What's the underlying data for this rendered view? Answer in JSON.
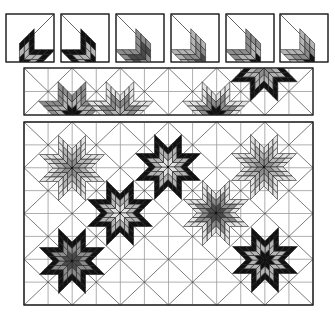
{
  "figure": {
    "palette": {
      "white": "#ffffff",
      "light": "#e2e2e2",
      "mid": "#b4b4b4",
      "grey": "#8c8c8c",
      "dark": "#4a4a4a",
      "black": "#111111",
      "line": "#222222",
      "grid": "#9a9a9a"
    }
  },
  "blocks": [
    {
      "x": 6,
      "y": 14,
      "s": 48,
      "corner": "tr",
      "shades": [
        "black",
        "mid",
        "black"
      ]
    },
    {
      "x": 61,
      "y": 14,
      "s": 48,
      "corner": "tl",
      "shades": [
        "black",
        "mid",
        "black"
      ]
    },
    {
      "x": 116,
      "y": 14,
      "s": 48,
      "corner": "tl",
      "shades": [
        "grey",
        "dark",
        "grey"
      ]
    },
    {
      "x": 171,
      "y": 14,
      "s": 48,
      "corner": "tl",
      "shades": [
        "dark",
        "grey",
        "mid"
      ]
    },
    {
      "x": 226,
      "y": 14,
      "s": 48,
      "corner": "tl",
      "shades": [
        "black",
        "mid",
        "grey"
      ]
    },
    {
      "x": 280,
      "y": 14,
      "s": 48,
      "corner": "tl",
      "shades": [
        "black",
        "grey",
        "mid"
      ]
    }
  ],
  "strip": {
    "x": 24,
    "y": 68,
    "w": 289,
    "h": 47,
    "cols": 12,
    "rows": 2,
    "stars": [
      {
        "cx": 72,
        "cy": 115,
        "arms": [
          0,
          1,
          2,
          3
        ],
        "shades": [
          "black",
          "mid",
          "grey"
        ]
      },
      {
        "cx": 120,
        "cy": 115,
        "arms": [
          4,
          5,
          6,
          7
        ],
        "shades": [
          "mid",
          "grey",
          "light"
        ]
      },
      {
        "cx": 216,
        "cy": 115,
        "arms": [
          4,
          5,
          6,
          7
        ],
        "shades": [
          "black",
          "grey",
          "light"
        ]
      },
      {
        "cx": 264,
        "cy": 68,
        "arms": [
          0,
          1,
          2,
          3
        ],
        "shades": [
          "grey",
          "mid",
          "black"
        ]
      }
    ]
  },
  "quilt": {
    "x": 24,
    "y": 122,
    "w": 289,
    "h": 183,
    "cols": 12,
    "rows": 8,
    "stars": [
      {
        "cx": 72,
        "cy": 168,
        "shades": [
          "grey",
          "mid",
          "light"
        ]
      },
      {
        "cx": 168,
        "cy": 167,
        "shades": [
          "light",
          "mid",
          "black"
        ]
      },
      {
        "cx": 264,
        "cy": 167,
        "shades": [
          "grey",
          "mid",
          "light"
        ]
      },
      {
        "cx": 120,
        "cy": 213,
        "shades": [
          "light",
          "mid",
          "black"
        ]
      },
      {
        "cx": 216,
        "cy": 213,
        "shades": [
          "dark",
          "grey",
          "light"
        ]
      },
      {
        "cx": 72,
        "cy": 261,
        "shades": [
          "dark",
          "grey",
          "black"
        ]
      },
      {
        "cx": 265,
        "cy": 260,
        "shades": [
          "black",
          "mid",
          "black"
        ]
      }
    ]
  }
}
